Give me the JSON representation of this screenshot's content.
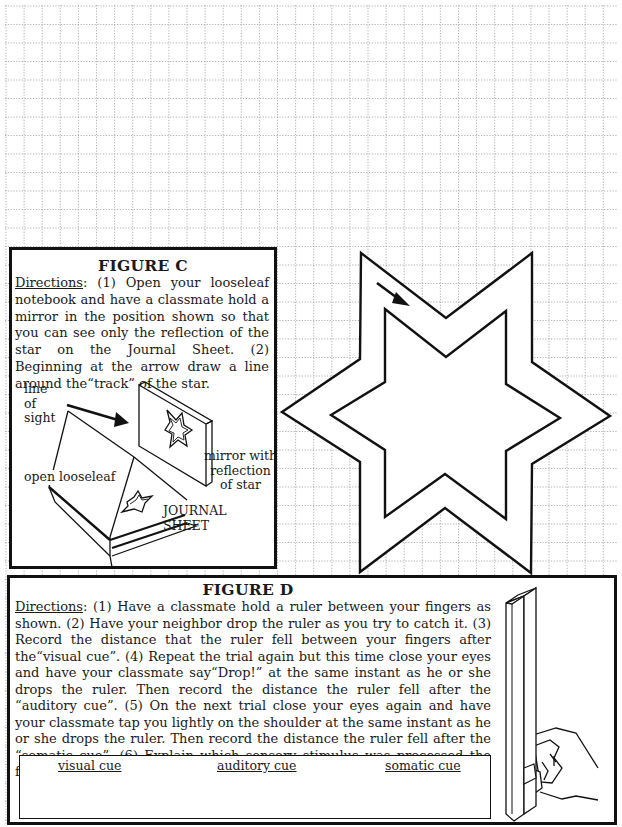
{
  "page": {
    "background": "#ffffff",
    "grid_color": "#8a8a8a",
    "ink_color": "#111111"
  },
  "figure_c": {
    "title": "FIGURE C",
    "directions_label": "Directions",
    "directions_text": ": (1) Open your looseleaf notebook and have a classmate hold a mirror in the position shown so that you can see only the reflection of the star on the Journal Sheet. (2) Beginning at the arrow draw a line around the“track” of the star.",
    "illustration": {
      "line_of_sight_label": [
        "line",
        "of",
        "sight"
      ],
      "mirror_label": [
        "mirror with",
        "reflection",
        "of star"
      ],
      "looseleaf_label": "open looseleaf",
      "journal_sheet_label": "JOURNAL SHEET"
    }
  },
  "star_track": {
    "start_marker": "arrow-start",
    "shape": "six-pointed star track"
  },
  "figure_d": {
    "title": "FIGURE D",
    "directions_label": "Directions",
    "directions_text": ": (1) Have a classmate hold a ruler between your fingers as shown. (2) Have your neighbor drop the ruler as you try to catch it. (3) Record the distance that the ruler fell between your fingers after the“visual cue”. (4) Repeat the trial again but this time close your eyes and have your classmate say“Drop!” at the same instant as he or she drops the ruler. Then record the distance the ruler fell after the “auditory cue”. (5) On the next trial close your eyes again and have your classmate tap you lightly on the shoulder at the same instant as he or she drops the ruler. Then record the distance the ruler fell after the “somatic cue”. (6) Explain which sensory stimulus was processed the fastest by your brain",
    "answer_table": {
      "columns": [
        "visual cue",
        "auditory cue",
        "somatic cue"
      ]
    }
  }
}
